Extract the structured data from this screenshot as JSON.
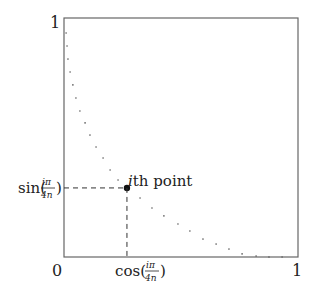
{
  "diagram": {
    "axis_labels": {
      "y_top": "1",
      "x_left": "0",
      "x_right": "1"
    },
    "point_label": {
      "italic": "i",
      "rest": "th point"
    },
    "sin_label": {
      "fn": "sin(",
      "num": "iπ",
      "den": "4n",
      "close": ")"
    },
    "cos_label": {
      "fn": "cos(",
      "num": "iπ",
      "den": "4n",
      "close": ")"
    },
    "highlight_index": 13,
    "points": [
      [
        0.009,
        0.937
      ],
      [
        0.013,
        0.883
      ],
      [
        0.017,
        0.828
      ],
      [
        0.026,
        0.774
      ],
      [
        0.038,
        0.72
      ],
      [
        0.051,
        0.665
      ],
      [
        0.068,
        0.611
      ],
      [
        0.09,
        0.561
      ],
      [
        0.111,
        0.51
      ],
      [
        0.137,
        0.46
      ],
      [
        0.167,
        0.414
      ],
      [
        0.197,
        0.364
      ],
      [
        0.231,
        0.322
      ],
      [
        0.269,
        0.289
      ],
      [
        0.325,
        0.247
      ],
      [
        0.376,
        0.205
      ],
      [
        0.427,
        0.172
      ],
      [
        0.487,
        0.138
      ],
      [
        0.538,
        0.109
      ],
      [
        0.594,
        0.075
      ],
      [
        0.65,
        0.054
      ],
      [
        0.705,
        0.033
      ],
      [
        0.761,
        0.013
      ],
      [
        0.821,
        0.004
      ],
      [
        0.876,
        0.0
      ],
      [
        0.932,
        0.0
      ]
    ]
  }
}
